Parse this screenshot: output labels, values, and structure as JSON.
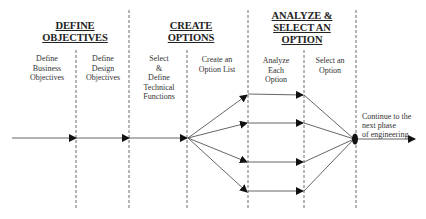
{
  "phases": [
    {
      "title": "DEFINE OBJECTIVES"
    },
    {
      "title": "CREATE OPTIONS"
    },
    {
      "title_line1": "ANALYZE &",
      "title_line2": "SELECT AN OPTION"
    }
  ],
  "steps": [
    {
      "line1": "Define",
      "line2": "Business",
      "line3": "Objectives"
    },
    {
      "line1": "Define",
      "line2": "Design",
      "line3": "Objectives"
    },
    {
      "line1": "Select",
      "line2": "&",
      "line3": "Define",
      "line4": "Technical",
      "line5": "Functions"
    },
    {
      "line1": "Create an",
      "line2": "Option List"
    },
    {
      "line1": "Analyze",
      "line2": "Each",
      "line3": "Option"
    },
    {
      "line1": "Select an",
      "line2": "Option"
    }
  ],
  "output_note": {
    "line1": "Continue to the",
    "line2": "next phase",
    "line3": "of engineering"
  },
  "colors": {
    "line": "#555555",
    "arrow": "#111111",
    "dash": "#444444"
  }
}
